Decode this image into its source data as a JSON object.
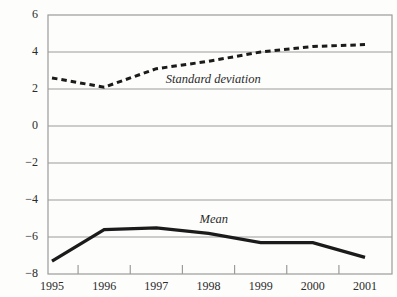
{
  "chart_data": {
    "type": "line",
    "title": "",
    "categories": [
      "1995",
      "1996",
      "1997",
      "1998",
      "1999",
      "2000",
      "2001"
    ],
    "series": [
      {
        "name": "Standard deviation",
        "style": "dashed",
        "values": [
          2.6,
          2.1,
          3.1,
          3.5,
          4.0,
          4.3,
          4.4
        ]
      },
      {
        "name": "Mean",
        "style": "solid",
        "values": [
          -7.3,
          -5.6,
          -5.5,
          -5.8,
          -6.3,
          -6.3,
          -7.1
        ]
      }
    ],
    "ylim": [
      -8,
      6
    ],
    "yticks": [
      6,
      4,
      2,
      0,
      -2,
      -4,
      -6,
      -8
    ],
    "ytick_labels": [
      "6",
      "4",
      "2",
      "0",
      "−2",
      "−4",
      "−6",
      "−8"
    ],
    "xlabel": "",
    "ylabel": "",
    "grid": "horizontal",
    "legend": "inline-annotations",
    "annotations": [
      {
        "text": "Standard deviation",
        "x": 3.09,
        "y": 2.5,
        "series": "Standard deviation"
      },
      {
        "text": "Mean",
        "x": 3.1,
        "y": -5.1,
        "series": "Mean"
      }
    ],
    "colors": {
      "line": "#1b1b1b",
      "grid": "#9b9b9b",
      "border": "#9b9b9b",
      "text": "#2b2b2b",
      "background": "#fdfdfb"
    }
  }
}
